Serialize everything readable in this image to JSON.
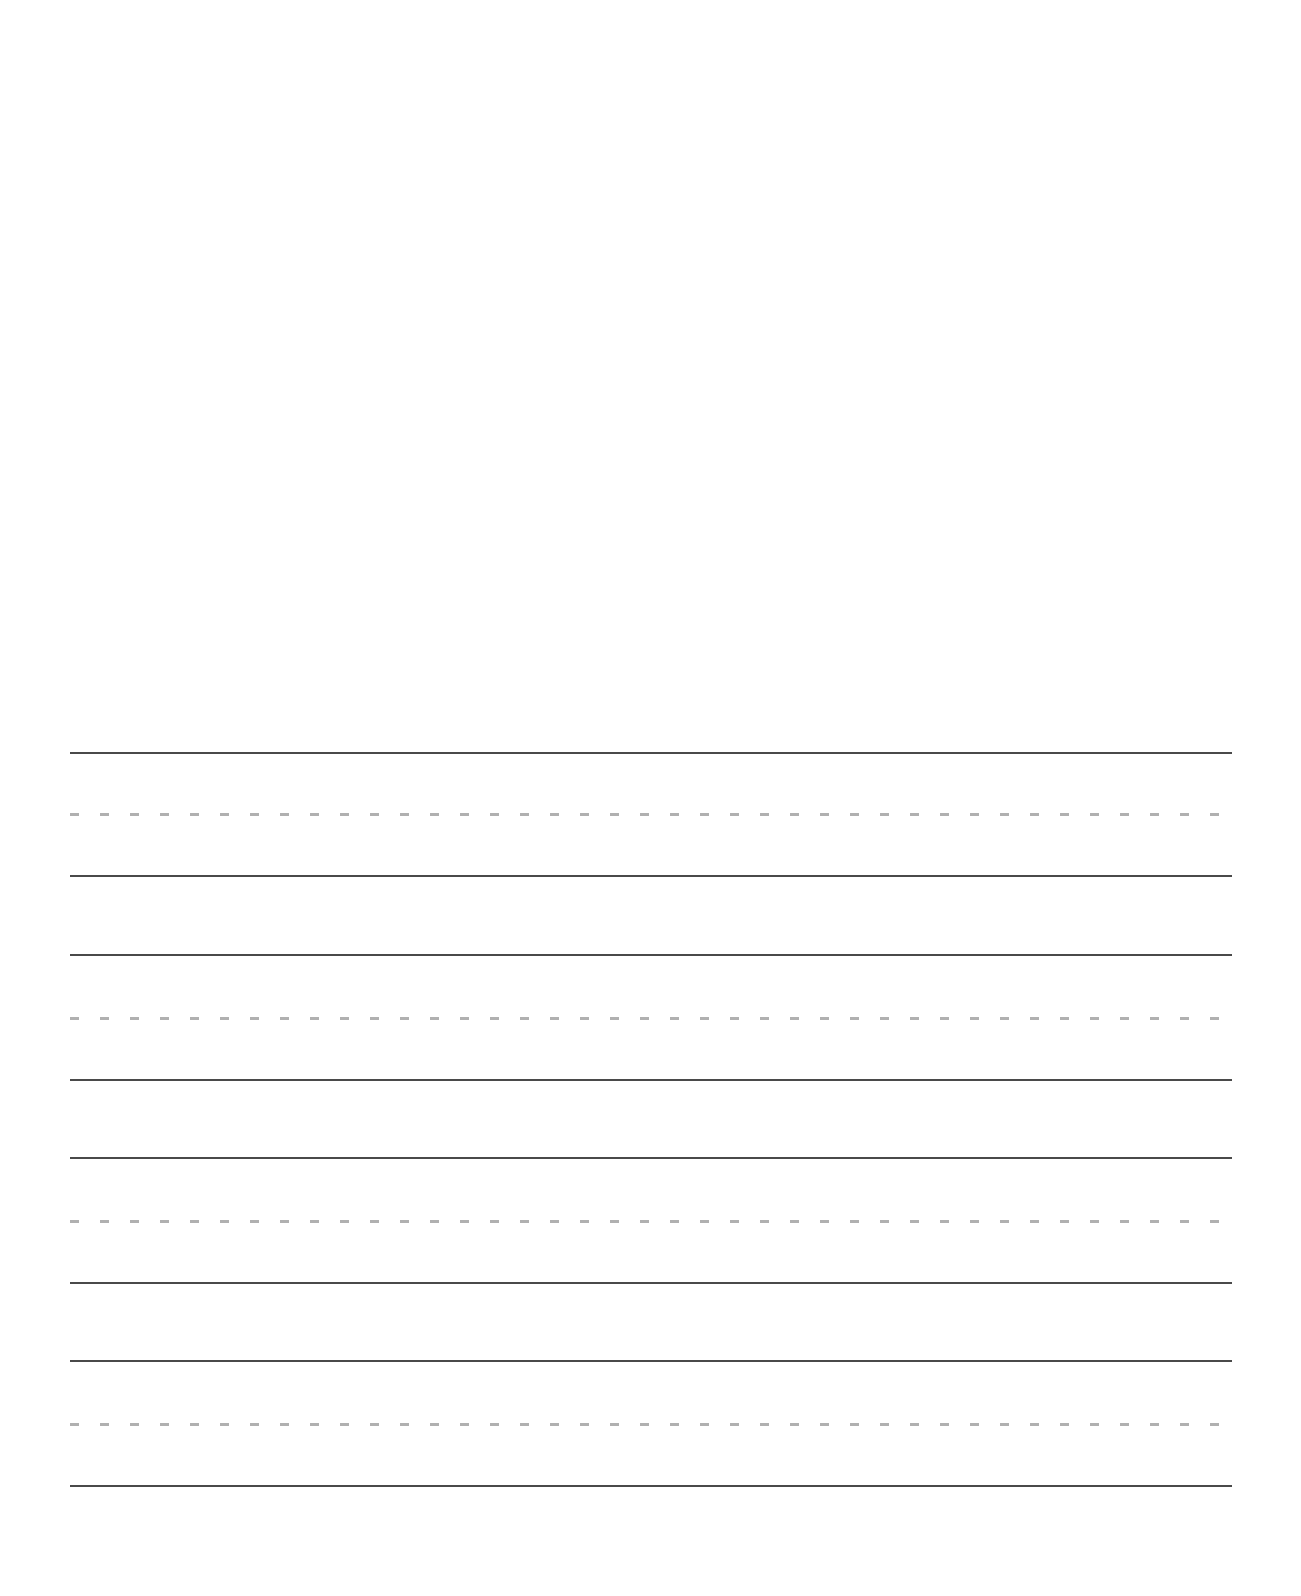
{
  "page": {
    "type": "handwriting-practice-sheet",
    "background": "#ffffff",
    "drawing_area": {
      "top": 0,
      "height": 730
    },
    "line_left": 70,
    "line_width": 1162,
    "colors": {
      "solid_line": "#4a4a4a",
      "dashed_line": "#b0b0b0"
    },
    "line_groups": [
      {
        "top_line": 753,
        "mid_line": 814,
        "base_line": 876
      },
      {
        "top_line": 955,
        "mid_line": 1018,
        "base_line": 1080
      },
      {
        "top_line": 1158,
        "mid_line": 1221,
        "base_line": 1283
      },
      {
        "top_line": 1361,
        "mid_line": 1424,
        "base_line": 1486
      }
    ]
  }
}
